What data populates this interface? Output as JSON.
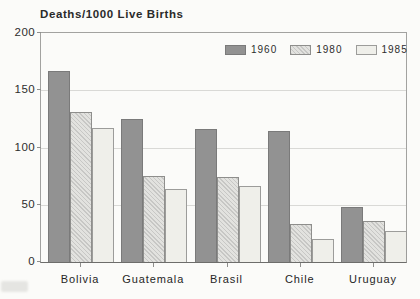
{
  "chart_data": {
    "type": "bar",
    "title": "Deaths/1000 Live Births",
    "categories": [
      "Bolivia",
      "Guatemala",
      "Brasil",
      "Chile",
      "Uruguay"
    ],
    "series": [
      {
        "name": "1960",
        "values": [
          167,
          125,
          116,
          114,
          48
        ]
      },
      {
        "name": "1980",
        "values": [
          131,
          75,
          74,
          33,
          36
        ]
      },
      {
        "name": "1985",
        "values": [
          117,
          64,
          66,
          20,
          27
        ]
      }
    ],
    "xlabel": "",
    "ylabel": "Deaths/1000 Live Births",
    "ylim": [
      0,
      200
    ],
    "yticks": [
      0,
      50,
      100,
      150,
      200
    ],
    "grid": true,
    "legend_position": "top-inside-right"
  },
  "colors": {
    "background": "#fbfbf9",
    "bar_1960": "#929292",
    "bar_1980_base": "#e2e2df",
    "bar_1980_hatch": "#c7c7c5",
    "bar_1985": "#efefea",
    "gridline": "#d9d9d6",
    "axis_frame": "#a2a2a0",
    "text": "#2a2a2a"
  }
}
